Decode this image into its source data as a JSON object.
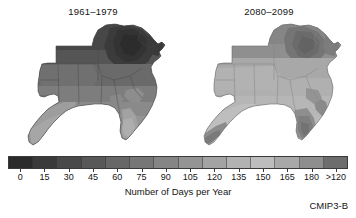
{
  "figure": {
    "background": "#ffffff",
    "credit": "CMIP3-B"
  },
  "panels": [
    {
      "title": "1961–1979",
      "name": "historical"
    },
    {
      "title": "2080–2099",
      "name": "projected"
    }
  ],
  "colorbar": {
    "axis_label": "Number of Days per Year",
    "tick_labels": [
      "0",
      "15",
      "30",
      "45",
      "60",
      "75",
      "90",
      "105",
      "120",
      "135",
      "150",
      "165",
      "180",
      ">120"
    ],
    "colors": [
      "#2b2b2b",
      "#3a3a3a",
      "#494949",
      "#585858",
      "#676767",
      "#767676",
      "#858585",
      "#949494",
      "#a3a3a3",
      "#b2b2b2",
      "#bdbdbd",
      "#a8a8a8",
      "#8e8e8e",
      "#6d6d6d"
    ]
  },
  "chart_data": {
    "type": "map",
    "title": "Number of Days per Year",
    "subtitle": "Southeast United States — CMIP3-B climate model projection",
    "region": "Southeast United States",
    "variable": "Number of Days per Year",
    "units": "days",
    "colormap": "grayscale (dark = fewer days, light = more days)",
    "legend_position": "bottom",
    "grid": false,
    "axis_ranges": {
      "value_min": 0,
      "value_max": 120,
      "overflow_label": ">120"
    },
    "tick_values": [
      0,
      15,
      30,
      45,
      60,
      75,
      90,
      105,
      120,
      135,
      150,
      165,
      180
    ],
    "panels": [
      {
        "name": "historical",
        "title": "1961–1979",
        "description": "Historical baseline. Northern interior and Appalachian highlands show the lowest day counts (dark); south Florida and the Gulf Coast show the highest (light).",
        "regional_estimates": [
          {
            "region": "Appalachian Mountains / Tennessee highlands",
            "value": 15
          },
          {
            "region": "Kentucky / Virginia interior",
            "value": 30
          },
          {
            "region": "North Carolina Piedmont",
            "value": 45
          },
          {
            "region": "Arkansas / northern Mississippi",
            "value": 60
          },
          {
            "region": "Alabama / Georgia interior",
            "value": 75
          },
          {
            "region": "Louisiana Gulf Coast",
            "value": 90
          },
          {
            "region": "North Florida",
            "value": 105
          },
          {
            "region": "South Florida peninsula",
            "value": 120
          }
        ]
      },
      {
        "name": "projected",
        "title": "2080–2099",
        "description": "End-of-century projection. Nearly the entire region shifts to lighter tones, indicating substantially more days per year; only the highest Appalachian terrain and parts of the Gulf/Atlantic coastal fringe remain darker.",
        "regional_estimates": [
          {
            "region": "Appalachian Mountains / Tennessee highlands",
            "value": 75
          },
          {
            "region": "Kentucky / Virginia interior",
            "value": 90
          },
          {
            "region": "North Carolina Piedmont",
            "value": 105
          },
          {
            "region": "Arkansas / northern Mississippi",
            "value": 120
          },
          {
            "region": "Alabama / Georgia interior",
            "value": 135
          },
          {
            "region": "Louisiana Gulf Coast",
            "value": 150
          },
          {
            "region": "North Florida",
            "value": 165
          },
          {
            "region": "South Florida peninsula",
            "value": 180
          }
        ]
      }
    ]
  }
}
